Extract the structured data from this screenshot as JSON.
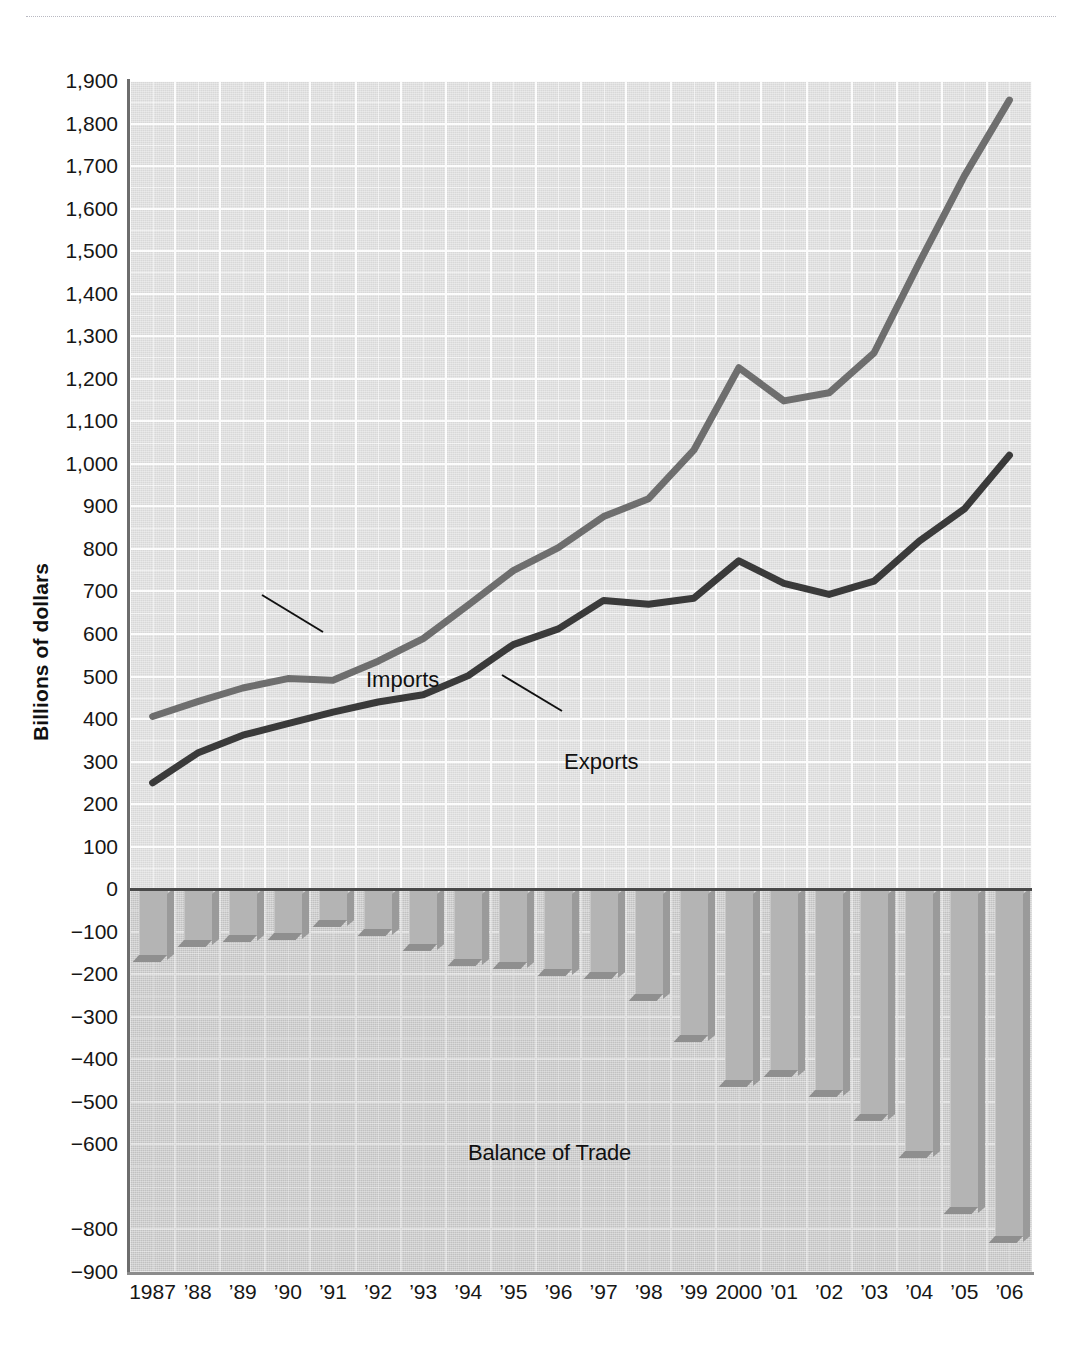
{
  "figure": {
    "ylabel": "Billions of dollars",
    "annotations": {
      "imports": "Imports",
      "exports": "Exports",
      "balance": "Balance of Trade"
    }
  },
  "chart_data": {
    "type": "line",
    "title": "",
    "xlabel": "",
    "ylabel": "Billions of dollars",
    "ylim": [
      -900,
      1900
    ],
    "grid": true,
    "legend_position": "inline-annotation",
    "x": [
      1987,
      1988,
      1989,
      1990,
      1991,
      1992,
      1993,
      1994,
      1995,
      1996,
      1997,
      1998,
      1999,
      2000,
      2001,
      2002,
      2003,
      2004,
      2005,
      2006
    ],
    "categories": [
      "1987",
      "’88",
      "’89",
      "’90",
      "’91",
      "’92",
      "’93",
      "’94",
      "’95",
      "’96",
      "’97",
      "’98",
      "’99",
      "2000",
      "’01",
      "’02",
      "’03",
      "’04",
      "’05",
      "’06"
    ],
    "ytick_labels": [
      "1,900",
      "1,800",
      "1,700",
      "1,600",
      "1,500",
      "1,400",
      "1,300",
      "1,200",
      "1,100",
      "1,000",
      "900",
      "800",
      "700",
      "600",
      "500",
      "400",
      "300",
      "200",
      "100",
      "0",
      "−100",
      "−200",
      "−300",
      "−400",
      "−500",
      "−600",
      "−800",
      "−900"
    ],
    "ytick_values": [
      1900,
      1800,
      1700,
      1600,
      1500,
      1400,
      1300,
      1200,
      1100,
      1000,
      900,
      800,
      700,
      600,
      500,
      400,
      300,
      200,
      100,
      0,
      -100,
      -200,
      -300,
      -400,
      -500,
      -600,
      -800,
      -900
    ],
    "series": [
      {
        "name": "Imports",
        "type": "line",
        "color": "#6e6e6e",
        "values": [
          406,
          441,
          473,
          495,
          491,
          536,
          589,
          668,
          749,
          803,
          876,
          918,
          1032,
          1226,
          1148,
          1167,
          1261,
          1473,
          1677,
          1855
        ]
      },
      {
        "name": "Exports",
        "type": "line",
        "color": "#3a3a3a",
        "values": [
          250,
          320,
          362,
          389,
          416,
          440,
          457,
          502,
          575,
          612,
          679,
          670,
          684,
          772,
          719,
          693,
          724,
          818,
          894,
          1020
        ]
      },
      {
        "name": "Balance of Trade",
        "type": "bar",
        "color": "#b4b4b4",
        "values": [
          -156,
          -121,
          -111,
          -106,
          -75,
          -96,
          -132,
          -166,
          -174,
          -191,
          -197,
          -248,
          -346,
          -452,
          -428,
          -474,
          -532,
          -618,
          -750,
          -818
        ]
      }
    ]
  }
}
